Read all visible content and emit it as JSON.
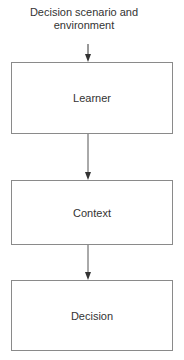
{
  "diagram": {
    "type": "flowchart",
    "direction": "top-to-bottom",
    "input": {
      "label_line1": "Decision scenario and",
      "label_line2": "environment"
    },
    "nodes": [
      {
        "id": "learner",
        "label": "Learner"
      },
      {
        "id": "context",
        "label": "Context"
      },
      {
        "id": "decision",
        "label": "Decision"
      }
    ],
    "edges": [
      {
        "from": "input",
        "to": "learner"
      },
      {
        "from": "learner",
        "to": "context"
      },
      {
        "from": "context",
        "to": "decision"
      }
    ],
    "colors": {
      "border": "#8a8a8a",
      "text": "#333333",
      "arrow": "#333333",
      "background": "#ffffff"
    }
  }
}
